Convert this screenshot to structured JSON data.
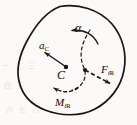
{
  "figure": {
    "kind": "rigid-body-inertia-diagram",
    "width": 137,
    "height": 125,
    "background_color": "#fbfaf8",
    "ink_color": "#191714",
    "labels": {
      "angular_acceleration": "α",
      "acceleration_symbol": "a",
      "acceleration_subscript": "C",
      "center_of_mass": "C",
      "inertia_force_symbol": "F",
      "inertia_force_subscript_i": "i",
      "inertia_force_subscript_r": "R",
      "inertia_moment_symbol": "M",
      "inertia_moment_subscript_i": "i",
      "inertia_moment_subscript_r": "R"
    },
    "elements": [
      {
        "name": "body-outline",
        "description": "closed irregular blob representing the rigid body",
        "style": "solid",
        "stroke_width": 1.6
      },
      {
        "name": "alpha-arc-arrow",
        "description": "solid curved arrow near top indicating angular acceleration, arrowhead pointing left",
        "style": "solid",
        "direction": "counterclockwise"
      },
      {
        "name": "acceleration-vector",
        "description": "straight arrow from C pointing up-left",
        "style": "solid",
        "from": [
          66,
          67
        ],
        "to": [
          42,
          51
        ]
      },
      {
        "name": "center-of-mass-dot",
        "description": "filled dot marking mass center C",
        "at": [
          66,
          67
        ]
      },
      {
        "name": "resultant-node-dot",
        "description": "filled dot where dashed line meets the inertia force vector",
        "at": [
          85,
          70
        ]
      },
      {
        "name": "inertia-force-vector",
        "description": "dashed straight arrow from node pointing down-right",
        "style": "dashed",
        "from": [
          85,
          70
        ],
        "to": [
          112,
          85
        ]
      },
      {
        "name": "dashed-guide-curve",
        "description": "dashed curve running from upper body down through node",
        "style": "dashed"
      },
      {
        "name": "inertia-moment-arc-arrow",
        "description": "dashed curved arrow at lower left, arrowhead pointing up-left",
        "style": "dashed",
        "direction": "counterclockwise"
      }
    ],
    "scan_artifacts": {
      "note": "faint bleed-through marks from reverse page",
      "marks": [
        "一 二 三",
        "四 五",
        "六 七 八"
      ]
    }
  }
}
